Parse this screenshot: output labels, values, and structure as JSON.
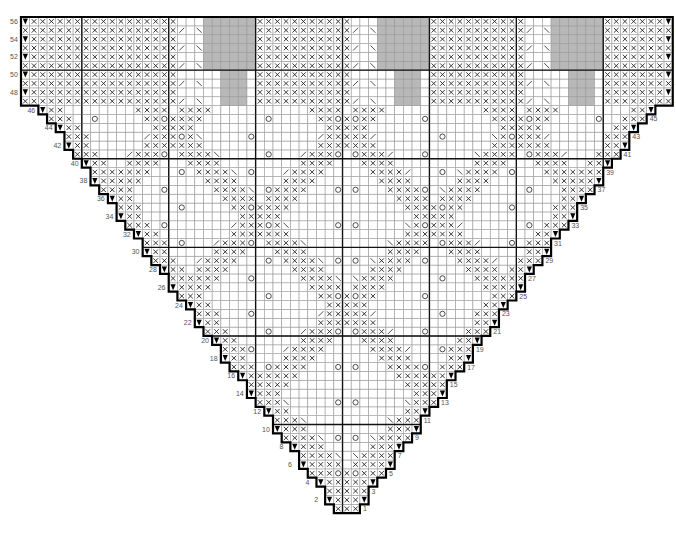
{
  "chart_title": "Triangular shawl lace knitting chart",
  "legend_symbols": {
    "knit_blank": "",
    "purl_x": "×",
    "yarn_over": "○",
    "k2tog_right": "/",
    "ssk_left": "\\",
    "double_decrease": "^",
    "increase_marker": "▼",
    "no_stitch": "gray"
  },
  "colors": {
    "grid_line": "#9a9a9a",
    "thick_line": "#111111",
    "no_stitch_fill": "#b8b8b8",
    "symbol": "#222222",
    "label": "#555555",
    "background": "#ffffff"
  },
  "grid": {
    "left": 21,
    "top": 17,
    "cols": 75,
    "rows": 56,
    "cell_w": 8.69,
    "cell_h": 8.86,
    "center_col": 37,
    "thick_col_lines": [
      0,
      7,
      17,
      27,
      37,
      47,
      57,
      67,
      75
    ],
    "thick_row_lines_from_top": [
      0,
      6,
      16,
      26,
      36,
      46,
      56
    ]
  },
  "row_labels": {
    "left_even": [
      2,
      4,
      6,
      8,
      10,
      12,
      14,
      16,
      18,
      20,
      22,
      24,
      26,
      28,
      30,
      32,
      34,
      36,
      38,
      40,
      42,
      44,
      46,
      48,
      50,
      52,
      54,
      56
    ],
    "right_odd": [
      1,
      3,
      5,
      7,
      9,
      11,
      13,
      15,
      17,
      19,
      21,
      23,
      25,
      27,
      29,
      31,
      33,
      35,
      37,
      39,
      41,
      43,
      45,
      47,
      49,
      51,
      53,
      55
    ]
  },
  "chart_data": {
    "type": "table",
    "row_count": 56,
    "max_stitches": 75,
    "row_numbers_right": "odd (RS)",
    "row_numbers_left": "even (WS)",
    "first_row_stitches": 3,
    "increase_symbol": "▼ at both edges on every other row",
    "motif": "purl-X diamond lattice with yarn-over eyelet columns; top band rows 47–56 includes gray no-stitch wedges"
  }
}
